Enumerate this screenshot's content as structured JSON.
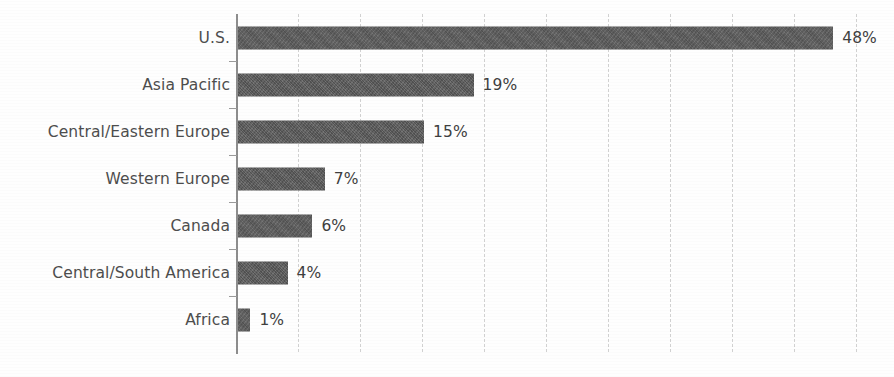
{
  "chart_data": {
    "type": "bar",
    "orientation": "horizontal",
    "title": "",
    "subtitle": "",
    "xlabel": "",
    "ylabel": "",
    "categories": [
      "U.S.",
      "Asia Pacific",
      "Central/Eastern Europe",
      "Western Europe",
      "Canada",
      "Central/South America",
      "Africa"
    ],
    "values": [
      48,
      19,
      15,
      7,
      6,
      4,
      1
    ],
    "value_labels": [
      "48%",
      "19%",
      "15%",
      "7%",
      "6%",
      "4%",
      "1%"
    ],
    "unit": "%",
    "xlim": [
      0,
      50
    ],
    "gridlines": true,
    "gridline_step": 5,
    "gridline_values": [
      0,
      5,
      10,
      15,
      20,
      25,
      30,
      35,
      40,
      45,
      50
    ],
    "xtick_labels": [],
    "legend": null,
    "legend_position": "none",
    "bar_color": "#575757",
    "gridline_color": "#c9c9c9",
    "axis_color": "#8d8d8d",
    "label_color": "#4d4d4d",
    "value_label_color": "#3f3f3f",
    "background_color": "#ffffff"
  }
}
